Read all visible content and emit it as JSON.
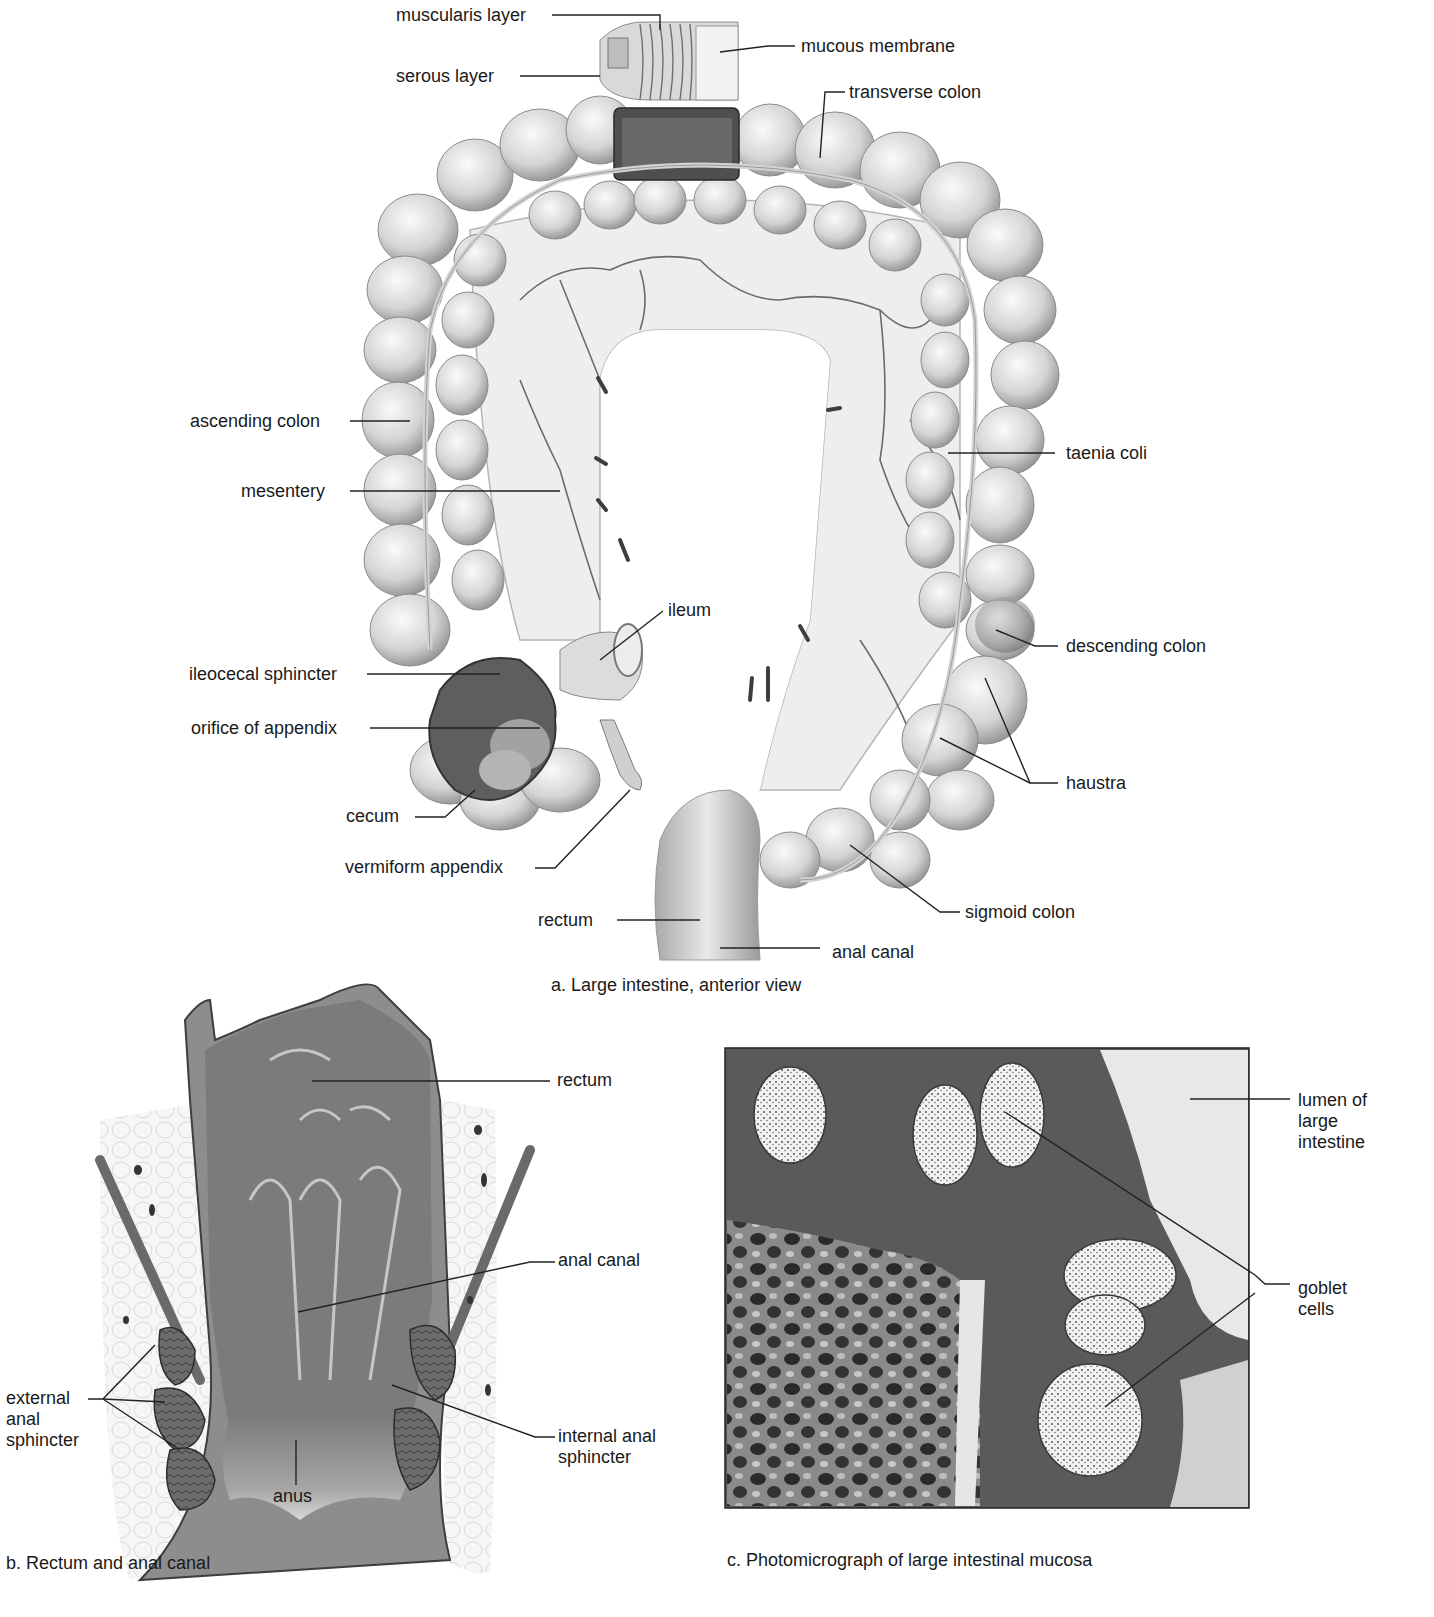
{
  "figure": {
    "panels": [
      {
        "id": "a",
        "caption": "a. Large intestine, anterior view",
        "labels": [
          {
            "id": "muscularis-layer",
            "text": "muscularis layer"
          },
          {
            "id": "mucous-membrane",
            "text": "mucous membrane"
          },
          {
            "id": "serous-layer",
            "text": "serous layer"
          },
          {
            "id": "transverse-colon",
            "text": "transverse colon"
          },
          {
            "id": "ascending-colon",
            "text": "ascending colon"
          },
          {
            "id": "taenia-coli",
            "text": "taenia coli"
          },
          {
            "id": "mesentery",
            "text": "mesentery"
          },
          {
            "id": "ileum",
            "text": "ileum"
          },
          {
            "id": "descending-colon",
            "text": "descending colon"
          },
          {
            "id": "ileocecal-sphincter",
            "text": "ileocecal sphincter"
          },
          {
            "id": "orifice-of-appendix",
            "text": "orifice of appendix"
          },
          {
            "id": "haustra",
            "text": "haustra"
          },
          {
            "id": "cecum",
            "text": "cecum"
          },
          {
            "id": "vermiform-appendix",
            "text": "vermiform appendix"
          },
          {
            "id": "sigmoid-colon",
            "text": "sigmoid colon"
          },
          {
            "id": "rectum",
            "text": "rectum"
          },
          {
            "id": "anal-canal",
            "text": "anal canal"
          }
        ]
      },
      {
        "id": "b",
        "caption": "b. Rectum and anal canal",
        "labels": [
          {
            "id": "rectum",
            "text": "rectum"
          },
          {
            "id": "anal-canal",
            "text": "anal canal"
          },
          {
            "id": "external-anal-sphincter",
            "text": "external anal sphincter"
          },
          {
            "id": "internal-anal-sphincter",
            "text": "internal anal sphincter"
          },
          {
            "id": "anus",
            "text": "anus"
          }
        ]
      },
      {
        "id": "c",
        "caption": "c. Photomicrograph of large intestinal mucosa",
        "labels": [
          {
            "id": "lumen-of-large-intestine",
            "text": "lumen of large intestine"
          },
          {
            "id": "goblet-cells",
            "text": "goblet cells"
          }
        ]
      }
    ]
  },
  "colors": {
    "background": "#ffffff",
    "ink": "#1a1a1a",
    "tissue_light": "#e6e6e6",
    "tissue_mid": "#bdbdbd",
    "tissue_dark": "#5a5a5a",
    "micrograph_dark": "#2b2b2b"
  }
}
